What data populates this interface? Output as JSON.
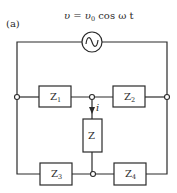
{
  "panel_label": "(a)",
  "source": {
    "equation_v": "υ",
    "equation_eq": " = ",
    "equation_v0": "υ",
    "equation_v0_sub": "0",
    "equation_rest": " cos ω t",
    "symbol": "ac-source"
  },
  "impedances": {
    "z1": {
      "main": "Z",
      "sub": "1"
    },
    "z2": {
      "main": "Z",
      "sub": "2"
    },
    "z3": {
      "main": "Z",
      "sub": "3"
    },
    "z4": {
      "main": "Z",
      "sub": "4"
    },
    "z": {
      "main": "Z"
    }
  },
  "current_label": "i",
  "colors": {
    "line": "#2a2a2a",
    "background": "#ffffff"
  }
}
